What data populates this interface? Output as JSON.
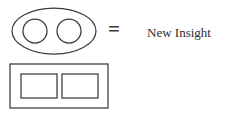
{
  "diagram": {
    "type": "equivalence-diagram",
    "background_color": "#ffffff",
    "stroke_color": "#3a3a3a",
    "text_color": "#2e2e2e",
    "rows": [
      {
        "id": "ellipse-row",
        "shape_name": "ellipse-with-two-circles",
        "shape_description": "Large horizontal ellipse containing two equal circles side by side",
        "operator": "=",
        "label": "New Insight"
      },
      {
        "id": "rectangle-row",
        "shape_name": "rectangle-with-two-rectangles",
        "shape_description": "Large horizontal rectangle containing two equal rectangles side by side",
        "operator": "=",
        "label": "New Insight"
      }
    ]
  }
}
